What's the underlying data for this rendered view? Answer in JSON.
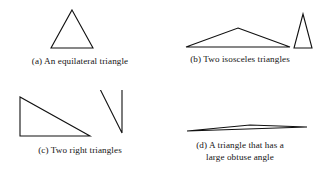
{
  "figure": {
    "background_color": "#ffffff",
    "stroke_color": "#111111",
    "panels": [
      {
        "id": "a",
        "caption": "(a) An equilateral triangle",
        "shape_name": "equilateral-triangle",
        "shapes": [
          {
            "name": "equilateral-triangle",
            "points": "72,10 93,48 51,48",
            "stroke_width": 1.1
          }
        ]
      },
      {
        "id": "b",
        "caption": "(b) Two isosceles triangles",
        "shape_name": "two-isosceles-triangles",
        "shapes": [
          {
            "name": "wide-isosceles-triangle",
            "points": "78,28 130,47 26,47",
            "stroke_width": 1.1
          },
          {
            "name": "narrow-isosceles-triangle",
            "points": "143,14 152,48 134,48",
            "stroke_width": 1.1
          }
        ]
      },
      {
        "id": "c",
        "caption": "(c) Two right triangles",
        "shape_name": "two-right-triangles",
        "shapes": [
          {
            "name": "right-triangle-left",
            "points": "20,7 20,46 90,46",
            "stroke_width": 1.1
          },
          {
            "name": "right-triangle-right",
            "points": "100,0 122,0 122,43",
            "stroke_width": 1.1
          }
        ]
      },
      {
        "id": "d",
        "caption": "(d) A triangle that has a\nlarge obtuse angle",
        "shape_name": "obtuse-sliver-triangle",
        "shapes": [
          {
            "name": "obtuse-sliver-triangle",
            "points": "27,41 147,37 90,35",
            "stroke_width": 1.1
          }
        ]
      }
    ]
  }
}
